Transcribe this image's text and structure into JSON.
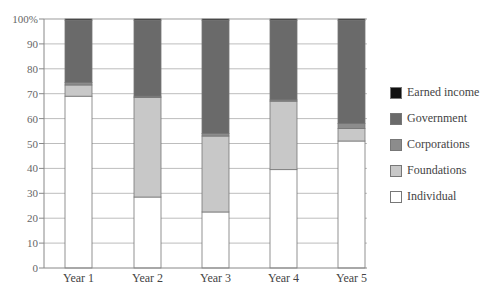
{
  "chart_data": {
    "type": "bar",
    "stacked": true,
    "title": "",
    "xlabel": "",
    "ylabel": "",
    "ylim": [
      0,
      100
    ],
    "yticks": [
      "0",
      "10",
      "20",
      "30",
      "40",
      "50",
      "60",
      "70",
      "80",
      "90",
      "100%"
    ],
    "categories": [
      "Year 1",
      "Year 2",
      "Year 3",
      "Year 4",
      "Year 5"
    ],
    "series": [
      {
        "name": "Individual",
        "color": "#ffffff",
        "values": [
          69,
          28.5,
          22.5,
          39.5,
          51
        ]
      },
      {
        "name": "Foundations",
        "color": "#c8c8c8",
        "values": [
          4.5,
          40,
          30.5,
          27.5,
          5
        ]
      },
      {
        "name": "Corporations",
        "color": "#8c8c8c",
        "values": [
          1,
          0.5,
          1,
          0.5,
          2
        ]
      },
      {
        "name": "Government",
        "color": "#6a6a6a",
        "values": [
          25,
          30.5,
          45.5,
          32,
          41.5
        ]
      },
      {
        "name": "Earned income",
        "color": "#111111",
        "values": [
          0.5,
          0.5,
          0.5,
          0.5,
          0.5
        ]
      }
    ],
    "grid": true,
    "legend_position": "right"
  },
  "legend": {
    "items": [
      {
        "label": "Earned income",
        "color": "#111111"
      },
      {
        "label": "Government",
        "color": "#6a6a6a"
      },
      {
        "label": "Corporations",
        "color": "#8c8c8c"
      },
      {
        "label": "Foundations",
        "color": "#c8c8c8"
      },
      {
        "label": "Individual",
        "color": "#ffffff"
      }
    ]
  }
}
